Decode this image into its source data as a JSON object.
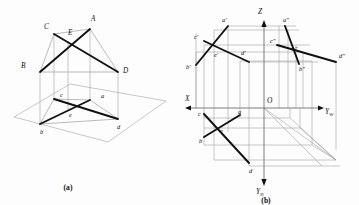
{
  "figure": {
    "title_a": "(a)",
    "title_b": "(b)"
  },
  "panel_a": {
    "name": "pictorial-view",
    "caption": "(a)",
    "labels": [
      {
        "id": "A",
        "text": "A",
        "x": 91,
        "y": 21
      },
      {
        "id": "B",
        "text": "B",
        "x": 22,
        "y": 66
      },
      {
        "id": "C",
        "text": "C",
        "x": 45,
        "y": 28
      },
      {
        "id": "D",
        "text": "D",
        "x": 124,
        "y": 70
      },
      {
        "id": "E",
        "text": "E",
        "x": 67,
        "y": 33
      },
      {
        "id": "a",
        "text": "a",
        "x": 102,
        "y": 97
      },
      {
        "id": "b",
        "text": "b",
        "x": 42,
        "y": 122
      },
      {
        "id": "c",
        "text": "c",
        "x": 61,
        "y": 95
      },
      {
        "id": "d",
        "text": "d",
        "x": 116,
        "y": 118
      },
      {
        "id": "e",
        "text": "e",
        "x": 70,
        "y": 112
      }
    ]
  },
  "panel_b": {
    "name": "orthographic-projection",
    "caption": "(b)",
    "axes": [
      {
        "id": "Z",
        "text": "Z",
        "sub": "",
        "x": 261,
        "y": 12
      },
      {
        "id": "X",
        "text": "X",
        "sub": "",
        "x": 184,
        "y": 100
      },
      {
        "id": "YW",
        "text": "Y",
        "sub": "W",
        "x": 327,
        "y": 114
      },
      {
        "id": "YH",
        "text": "Y",
        "sub": "H",
        "x": 259,
        "y": 190
      },
      {
        "id": "O",
        "text": "O",
        "sub": "",
        "x": 266,
        "y": 104
      }
    ],
    "labels": [
      {
        "id": "a-prime",
        "text": "a′",
        "x": 222,
        "y": 22
      },
      {
        "id": "a-dprime",
        "text": "a″",
        "x": 285,
        "y": 22
      },
      {
        "id": "c-prime",
        "text": "c′",
        "x": 196,
        "y": 39
      },
      {
        "id": "c-dprime",
        "text": "c″",
        "x": 272,
        "y": 41
      },
      {
        "id": "e-prime",
        "text": "e′",
        "x": 216,
        "y": 56
      },
      {
        "id": "e-dprime",
        "text": "e″",
        "x": 294,
        "y": 51
      },
      {
        "id": "d-prime",
        "text": "d′",
        "x": 243,
        "y": 54
      },
      {
        "id": "d-dprime",
        "text": "d″",
        "x": 341,
        "y": 57
      },
      {
        "id": "b-prime",
        "text": "b′",
        "x": 185,
        "y": 62
      },
      {
        "id": "b-dprime",
        "text": "b″",
        "x": 300,
        "y": 67
      },
      {
        "id": "c",
        "text": "c",
        "x": 200,
        "y": 112
      },
      {
        "id": "a",
        "text": "a",
        "x": 239,
        "y": 111
      },
      {
        "id": "e",
        "text": "e",
        "x": 221,
        "y": 131
      },
      {
        "id": "b",
        "text": "b",
        "x": 203,
        "y": 140
      },
      {
        "id": "d",
        "text": "d",
        "x": 253,
        "y": 170
      }
    ]
  },
  "colors": {
    "ink": "#111111",
    "construction": "#9a9a9a",
    "axis": "#7d7d7d",
    "background": "#fdfdfd"
  }
}
